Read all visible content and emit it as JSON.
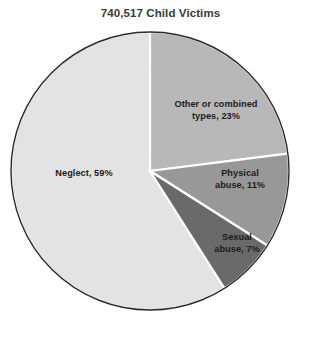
{
  "chart_data": {
    "type": "pie",
    "title": "740,517 Child Victims",
    "total_victims": "740,517",
    "categories": [
      "Other or combined types",
      "Physical abuse",
      "Sexual abuse",
      "Neglect"
    ],
    "values": [
      23,
      11,
      7,
      59
    ],
    "unit": "percent",
    "start_angle_deg": 0,
    "direction": "clockwise",
    "legend": "none",
    "labels_position": "inside-slice",
    "slices": [
      {
        "name": "Other or combined types",
        "label": "Other or combined types, 23%",
        "label_line1": "Other or combined",
        "label_line2": "types, 23%",
        "value": 23,
        "color": "#b8b8b8"
      },
      {
        "name": "Physical abuse",
        "label": "Physical abuse, 11%",
        "label_line1": "Physical",
        "label_line2": "abuse, 11%",
        "value": 11,
        "color": "#989898"
      },
      {
        "name": "Sexual abuse",
        "label": "Sexual abuse, 7%",
        "label_line1": "Sexual",
        "label_line2": "abuse, 7%",
        "value": 7,
        "color": "#6a6a6a"
      },
      {
        "name": "Neglect",
        "label": "Neglect, 59%",
        "label_line1": "Neglect, 59%",
        "label_line2": "",
        "value": 59,
        "color": "#e3e3e3"
      }
    ],
    "style": {
      "background": "#ffffff",
      "title_color": "#3a3a3a",
      "label_color": "#1c1c1c",
      "outline_color": "#2b2b2b",
      "divider_color": "#ffffff"
    }
  }
}
